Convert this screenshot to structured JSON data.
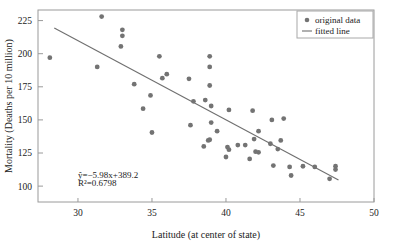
{
  "chart_data": {
    "type": "scatter",
    "title": "",
    "xlabel": "Latitude (at center of state)",
    "ylabel": "Mortality (Deaths per 10 million)",
    "xlim": [
      27.3,
      50.0
    ],
    "ylim": [
      88.0,
      233.0
    ],
    "xticks": [
      30,
      35,
      40,
      45,
      50
    ],
    "yticks": [
      100,
      125,
      150,
      175,
      200,
      225
    ],
    "xtick_labels": [
      "30",
      "35",
      "40",
      "45",
      "50"
    ],
    "ytick_labels": [
      "100",
      "125",
      "150",
      "175",
      "200",
      "225"
    ],
    "grid": false,
    "legend_position": "top-right",
    "legend": [
      {
        "label": "original data",
        "marker": "circle",
        "color": "#737373"
      },
      {
        "label": "fitted line",
        "marker": "line",
        "color": "#6f6f6f"
      }
    ],
    "annotations": [
      {
        "text": "ŷ=−5.98x+389.2",
        "x": 30.0,
        "y": 106.5
      },
      {
        "text": "R²=0.6798",
        "x": 30.0,
        "y": 100.0
      }
    ],
    "fit": {
      "slope": -5.98,
      "intercept": 389.2,
      "r_squared": 0.6798,
      "equation": "ŷ=−5.98x+389.2",
      "r_squared_label": "R²=0.6798",
      "x_start": 28.4,
      "x_end": 47.6
    },
    "series": [
      {
        "name": "original data",
        "points": [
          [
            28.1,
            197.0
          ],
          [
            31.3,
            190.0
          ],
          [
            31.6,
            228.0
          ],
          [
            32.9,
            205.5
          ],
          [
            33.0,
            218.0
          ],
          [
            33.0,
            213.5
          ],
          [
            33.8,
            177.0
          ],
          [
            34.4,
            158.5
          ],
          [
            34.9,
            168.5
          ],
          [
            35.0,
            140.5
          ],
          [
            35.5,
            198.0
          ],
          [
            35.7,
            181.5
          ],
          [
            36.0,
            184.5
          ],
          [
            37.5,
            181.0
          ],
          [
            37.6,
            146.0
          ],
          [
            37.8,
            164.0
          ],
          [
            38.5,
            130.0
          ],
          [
            38.6,
            165.0
          ],
          [
            38.8,
            134.5
          ],
          [
            38.9,
            135.0
          ],
          [
            38.9,
            198.0
          ],
          [
            38.9,
            190.0
          ],
          [
            38.9,
            176.0
          ],
          [
            39.0,
            160.5
          ],
          [
            39.0,
            148.0
          ],
          [
            39.4,
            141.5
          ],
          [
            40.0,
            122.0
          ],
          [
            40.1,
            129.5
          ],
          [
            40.2,
            127.5
          ],
          [
            40.2,
            157.5
          ],
          [
            40.8,
            131.0
          ],
          [
            41.3,
            131.0
          ],
          [
            41.6,
            120.5
          ],
          [
            41.8,
            157.0
          ],
          [
            41.9,
            135.5
          ],
          [
            42.0,
            126.0
          ],
          [
            42.2,
            141.5
          ],
          [
            42.2,
            125.5
          ],
          [
            43.0,
            132.0
          ],
          [
            43.1,
            150.0
          ],
          [
            43.2,
            115.5
          ],
          [
            43.5,
            128.0
          ],
          [
            43.7,
            134.5
          ],
          [
            43.9,
            151.0
          ],
          [
            44.3,
            114.5
          ],
          [
            44.4,
            108.0
          ],
          [
            45.2,
            115.0
          ],
          [
            46.0,
            114.5
          ],
          [
            47.0,
            105.5
          ],
          [
            47.4,
            115.0
          ],
          [
            47.4,
            112.5
          ]
        ]
      }
    ]
  }
}
